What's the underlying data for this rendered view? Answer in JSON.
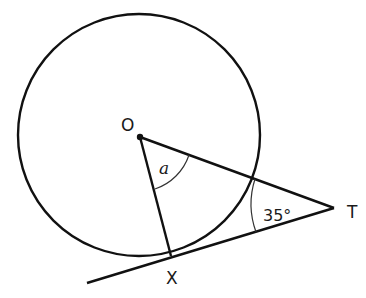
{
  "diagram": {
    "points": {
      "O": {
        "label": "O",
        "x": 140,
        "y": 137
      },
      "X": {
        "label": "X",
        "x": 171,
        "y": 256
      },
      "T": {
        "label": "T",
        "x": 334,
        "y": 208
      }
    },
    "circle": {
      "cx": 139,
      "cy": 135,
      "r": 121
    },
    "angles": {
      "at_O": {
        "label": "a"
      },
      "at_T": {
        "label": "35°",
        "value": 35
      }
    },
    "colors": {
      "stroke": "#111111",
      "arc": "#333333",
      "text": "#1a1a1a"
    }
  }
}
